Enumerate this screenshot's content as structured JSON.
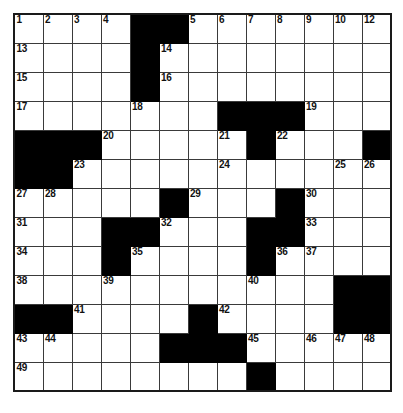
{
  "puzzle": {
    "type": "crossword-grid",
    "rows": 13,
    "cols": 13,
    "cell_size_px": 29,
    "colors": {
      "block": "#000000",
      "cell": "#ffffff",
      "grid_line": "#3a3a3a",
      "outer_border": "#1a1a1a",
      "number_text": "#111111"
    },
    "grid": [
      [
        "0",
        "0",
        "0",
        "0",
        "#",
        "#",
        "0",
        "0",
        "0",
        "0",
        "0",
        "0",
        "0"
      ],
      [
        "0",
        "0",
        "0",
        "0",
        "#",
        "0",
        "0",
        "0",
        "0",
        "0",
        "0",
        "0",
        "0"
      ],
      [
        "0",
        "0",
        "0",
        "0",
        "#",
        "0",
        "0",
        "0",
        "0",
        "0",
        "0",
        "0",
        "0"
      ],
      [
        "0",
        "0",
        "0",
        "0",
        "0",
        "0",
        "0",
        "#",
        "#",
        "#",
        "0",
        "0",
        "0"
      ],
      [
        "#",
        "#",
        "#",
        "0",
        "0",
        "0",
        "0",
        "0",
        "#",
        "0",
        "0",
        "0",
        "#"
      ],
      [
        "#",
        "#",
        "0",
        "0",
        "0",
        "0",
        "0",
        "0",
        "0",
        "0",
        "0",
        "0",
        "0"
      ],
      [
        "0",
        "0",
        "0",
        "0",
        "0",
        "#",
        "0",
        "0",
        "0",
        "#",
        "0",
        "0",
        "0"
      ],
      [
        "0",
        "0",
        "0",
        "#",
        "#",
        "0",
        "0",
        "0",
        "#",
        "#",
        "0",
        "0",
        "0"
      ],
      [
        "0",
        "0",
        "0",
        "#",
        "0",
        "0",
        "0",
        "0",
        "#",
        "0",
        "0",
        "0",
        "0"
      ],
      [
        "0",
        "0",
        "0",
        "0",
        "0",
        "0",
        "0",
        "0",
        "0",
        "0",
        "0",
        "#",
        "#"
      ],
      [
        "#",
        "#",
        "0",
        "0",
        "0",
        "0",
        "#",
        "0",
        "0",
        "0",
        "0",
        "#",
        "#"
      ],
      [
        "0",
        "0",
        "0",
        "0",
        "0",
        "#",
        "#",
        "#",
        "0",
        "0",
        "0",
        "0",
        "0"
      ],
      [
        "0",
        "0",
        "0",
        "0",
        "0",
        "0",
        "0",
        "0",
        "#",
        "0",
        "0",
        "0",
        "0"
      ]
    ],
    "numbers": [
      {
        "row": 0,
        "col": 0,
        "n": "1"
      },
      {
        "row": 0,
        "col": 1,
        "n": "2"
      },
      {
        "row": 0,
        "col": 2,
        "n": "3"
      },
      {
        "row": 0,
        "col": 3,
        "n": "4"
      },
      {
        "row": 0,
        "col": 6,
        "n": "5"
      },
      {
        "row": 0,
        "col": 7,
        "n": "6"
      },
      {
        "row": 0,
        "col": 8,
        "n": "7"
      },
      {
        "row": 0,
        "col": 9,
        "n": "8"
      },
      {
        "row": 0,
        "col": 10,
        "n": "9"
      },
      {
        "row": 0,
        "col": 11,
        "n": "10"
      },
      {
        "row": 0,
        "col": 12,
        "n": "11"
      },
      {
        "row": 1,
        "col": 0,
        "n": "13"
      },
      {
        "row": 1,
        "col": 5,
        "n": "14"
      },
      {
        "row": 2,
        "col": 0,
        "n": "15"
      },
      {
        "row": 2,
        "col": 5,
        "n": "16"
      },
      {
        "row": 3,
        "col": 0,
        "n": "17"
      },
      {
        "row": 3,
        "col": 4,
        "n": "18"
      },
      {
        "row": 3,
        "col": 10,
        "n": "19"
      },
      {
        "row": 4,
        "col": 3,
        "n": "20"
      },
      {
        "row": 4,
        "col": 7,
        "n": "21"
      },
      {
        "row": 4,
        "col": 9,
        "n": "22"
      },
      {
        "row": 5,
        "col": 2,
        "n": "23"
      },
      {
        "row": 5,
        "col": 7,
        "n": "24"
      },
      {
        "row": 5,
        "col": 11,
        "n": "25"
      },
      {
        "row": 5,
        "col": 12,
        "n": "26"
      },
      {
        "row": 6,
        "col": 0,
        "n": "27"
      },
      {
        "row": 6,
        "col": 1,
        "n": "28"
      },
      {
        "row": 6,
        "col": 6,
        "n": "29"
      },
      {
        "row": 6,
        "col": 10,
        "n": "30"
      },
      {
        "row": 7,
        "col": 0,
        "n": "31"
      },
      {
        "row": 7,
        "col": 5,
        "n": "32"
      },
      {
        "row": 7,
        "col": 10,
        "n": "33"
      },
      {
        "row": 8,
        "col": 0,
        "n": "34"
      },
      {
        "row": 8,
        "col": 4,
        "n": "35"
      },
      {
        "row": 8,
        "col": 9,
        "n": "36"
      },
      {
        "row": 8,
        "col": 10,
        "n": "37"
      },
      {
        "row": 9,
        "col": 0,
        "n": "38"
      },
      {
        "row": 9,
        "col": 3,
        "n": "39"
      },
      {
        "row": 9,
        "col": 8,
        "n": "40"
      },
      {
        "row": 10,
        "col": 2,
        "n": "41"
      },
      {
        "row": 10,
        "col": 7,
        "n": "42"
      },
      {
        "row": 11,
        "col": 0,
        "n": "43"
      },
      {
        "row": 11,
        "col": 1,
        "n": "44"
      },
      {
        "row": 11,
        "col": 8,
        "n": "45"
      },
      {
        "row": 11,
        "col": 10,
        "n": "46"
      },
      {
        "row": 11,
        "col": 11,
        "n": "47"
      },
      {
        "row": 11,
        "col": 12,
        "n": "48"
      },
      {
        "row": 12,
        "col": 0,
        "n": "49"
      }
    ],
    "numbers_extra": [
      {
        "row": 0,
        "col": 12,
        "n": "12"
      }
    ],
    "letters": []
  }
}
